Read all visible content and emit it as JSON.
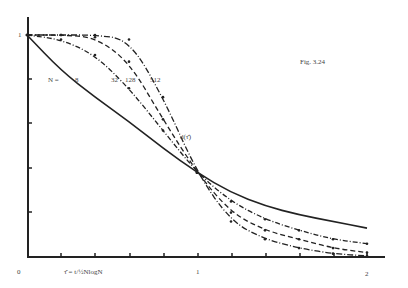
{
  "chart_data": {
    "type": "line",
    "title": "Fig. 3.24",
    "xlabel": "τ̂ = t/½NlogN",
    "ylabel": "",
    "curve_label": "d(τ̂)",
    "legend_prefix": "N =",
    "xlim": [
      0,
      2
    ],
    "ylim": [
      0,
      1
    ],
    "x_tick_labels": [
      "0",
      "1",
      "2"
    ],
    "y_tick_labels": [
      "1"
    ],
    "grid": false,
    "x": [
      0,
      0.2,
      0.4,
      0.6,
      0.8,
      1.0,
      1.2,
      1.4,
      1.6,
      1.8,
      2.0
    ],
    "series": [
      {
        "name": "8",
        "style": "solid",
        "values": [
          1.0,
          0.84,
          0.72,
          0.61,
          0.49,
          0.38,
          0.29,
          0.23,
          0.19,
          0.16,
          0.13
        ]
      },
      {
        "name": "32",
        "style": "dash-dot-dots",
        "values": [
          1.0,
          0.98,
          0.91,
          0.76,
          0.57,
          0.38,
          0.25,
          0.17,
          0.12,
          0.08,
          0.06
        ]
      },
      {
        "name": "128",
        "style": "dashed",
        "values": [
          1.0,
          1.0,
          0.99,
          0.88,
          0.62,
          0.38,
          0.2,
          0.12,
          0.08,
          0.04,
          0.02
        ]
      },
      {
        "name": "512",
        "style": "dash-dot",
        "values": [
          1.0,
          1.0,
          1.0,
          0.98,
          0.72,
          0.38,
          0.16,
          0.08,
          0.04,
          0.015,
          0.005
        ]
      }
    ]
  },
  "labels": {
    "fig": "Fig. 3.24",
    "n_prefix": "N =",
    "n8": "8",
    "n32": "32",
    "n128": "128",
    "n512": "512",
    "curve": "d(τ̂)",
    "xaxis": "τ̂ = t/½NlogN",
    "origin": "0",
    "x1": "1",
    "x2": "2",
    "y1": "1"
  }
}
